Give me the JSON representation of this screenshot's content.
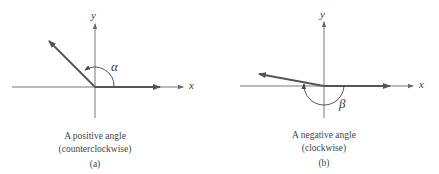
{
  "panels": [
    {
      "id": "a",
      "x_label": "x",
      "y_label": "y",
      "angle_symbol": "α",
      "caption_line1": "A positive angle",
      "caption_line2": "(counterclockwise)",
      "sublabel": "(a)"
    },
    {
      "id": "b",
      "x_label": "x",
      "y_label": "y",
      "angle_symbol": "β",
      "caption_line1": "A negative angle",
      "caption_line2": "(clockwise)",
      "sublabel": "(b)"
    }
  ],
  "colors": {
    "axis": "#6a6a6a",
    "ray": "#555555",
    "text": "#444444"
  }
}
